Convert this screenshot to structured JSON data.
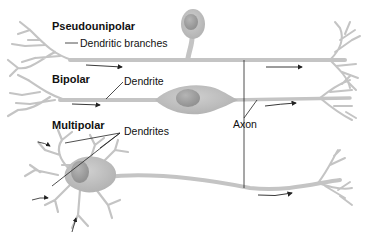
{
  "diagram": {
    "colors": {
      "neuron_fill": "#c8c8c8",
      "neuron_stroke": "#bdbdbd",
      "cell_body": "#b9b9b9",
      "nucleus": "#a4a4a4",
      "leader_line": "#222222",
      "arrow": "#222222"
    },
    "neurons": [
      {
        "type": "Pseudounipolar",
        "label": "Pseudounipolar",
        "annotation": "Dendritic branches"
      },
      {
        "type": "Bipolar",
        "label": "Bipolar",
        "annotation": "Dendrite"
      },
      {
        "type": "Multipolar",
        "label": "Multipolar",
        "annotation": "Dendrites"
      }
    ],
    "shared_annotation": "Axon"
  }
}
